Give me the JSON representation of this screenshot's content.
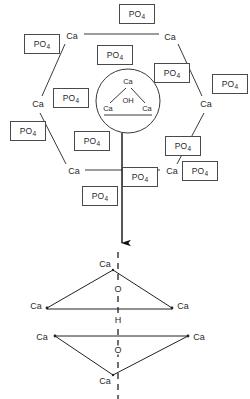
{
  "figure": {
    "stroke_color": "#3a3a3a",
    "text_color": "#2a2a2a",
    "background_color": "#ffffff",
    "width": 250,
    "height": 399
  },
  "labels": {
    "phosphate": "PO",
    "phosphate_sub": "4",
    "calcium": "Ca",
    "hydroxyl": "OH",
    "oxygen": "O",
    "hydrogen": "H"
  },
  "hexagon": {
    "name": "calcium-hexagon-ring",
    "vertices": [
      {
        "id": "ca-top-left",
        "label": "Ca",
        "x": 72,
        "y": 36
      },
      {
        "id": "ca-top-right",
        "label": "Ca",
        "x": 170,
        "y": 37
      },
      {
        "id": "ca-mid-right",
        "label": "Ca",
        "x": 206,
        "y": 104
      },
      {
        "id": "ca-bottom-right",
        "label": "Ca",
        "x": 172,
        "y": 171
      },
      {
        "id": "ca-bottom-left",
        "label": "Ca",
        "x": 74,
        "y": 171
      },
      {
        "id": "ca-mid-left",
        "label": "Ca",
        "x": 38,
        "y": 104
      }
    ]
  },
  "central_group": {
    "name": "hydroxyl-calcium-triangle",
    "circle": {
      "cx": 128,
      "cy": 101,
      "r": 32
    },
    "atoms": [
      {
        "id": "ca-apex",
        "label": "Ca",
        "x": 128,
        "y": 82
      },
      {
        "id": "ca-lower-left",
        "label": "Ca",
        "x": 108,
        "y": 108
      },
      {
        "id": "ca-lower-right",
        "label": "Ca",
        "x": 146,
        "y": 108
      },
      {
        "id": "oh-center",
        "label": "OH",
        "x": 128,
        "y": 100
      }
    ]
  },
  "phosphate_boxes": [
    {
      "id": "po4-top",
      "x": 137,
      "y": 14
    },
    {
      "id": "po4-upper-left",
      "x": 42,
      "y": 44
    },
    {
      "id": "po4-upper-mid",
      "x": 115,
      "y": 55
    },
    {
      "id": "po4-upper-right",
      "x": 172,
      "y": 73
    },
    {
      "id": "po4-far-right",
      "x": 230,
      "y": 84
    },
    {
      "id": "po4-left-inner",
      "x": 71,
      "y": 98
    },
    {
      "id": "po4-far-left",
      "x": 28,
      "y": 131
    },
    {
      "id": "po4-lower-left",
      "x": 92,
      "y": 141
    },
    {
      "id": "po4-lower-right",
      "x": 183,
      "y": 146
    },
    {
      "id": "po4-center-low",
      "x": 140,
      "y": 177
    },
    {
      "id": "po4-bottom-right",
      "x": 200,
      "y": 171
    },
    {
      "id": "po4-bottom",
      "x": 100,
      "y": 196
    }
  ],
  "arrow": {
    "name": "downward-arrow",
    "x": 122,
    "y_start": 133,
    "y_end": 252
  },
  "lower_structures": [
    {
      "name": "upper-triangle",
      "orientation": "apex-up",
      "atoms": [
        {
          "id": "ca-apex-up",
          "label": "Ca",
          "x": 113,
          "y": 264
        },
        {
          "id": "ca-left-up",
          "label": "Ca",
          "x": 40,
          "y": 306
        },
        {
          "id": "ca-right-up",
          "label": "Ca",
          "x": 179,
          "y": 306
        },
        {
          "id": "o-upper",
          "label": "O",
          "x": 118,
          "y": 289
        }
      ]
    },
    {
      "name": "lower-triangle",
      "orientation": "apex-down",
      "atoms": [
        {
          "id": "ca-left-down",
          "label": "Ca",
          "x": 45,
          "y": 338
        },
        {
          "id": "ca-right-down",
          "label": "Ca",
          "x": 196,
          "y": 338
        },
        {
          "id": "ca-apex-down",
          "label": "Ca",
          "x": 113,
          "y": 381
        },
        {
          "id": "o-lower",
          "label": "O",
          "x": 118,
          "y": 350
        }
      ]
    }
  ],
  "hydrogen_bond": {
    "name": "hydrogen-atom",
    "label": "H",
    "x": 118,
    "y": 320
  },
  "axis": {
    "name": "c-axis-dashed-line",
    "x": 118,
    "y_start": 252,
    "y_end": 399
  }
}
